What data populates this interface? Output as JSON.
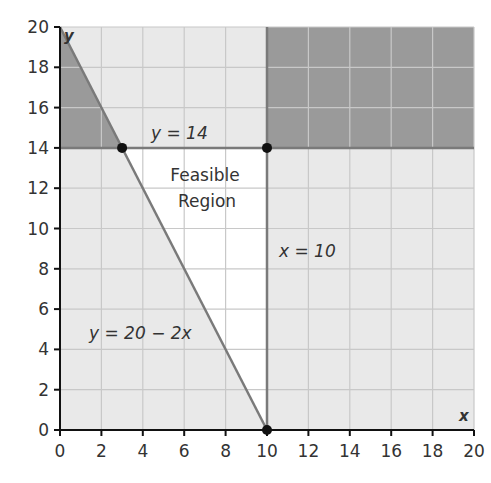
{
  "chart_data": {
    "type": "line",
    "title": "",
    "xlabel": "x",
    "ylabel": "y",
    "xlim": [
      0,
      20
    ],
    "ylim": [
      0,
      20
    ],
    "grid": true,
    "x_ticks": [
      "0",
      "2",
      "4",
      "6",
      "8",
      "10",
      "12",
      "14",
      "16",
      "18",
      "20"
    ],
    "y_ticks": [
      "0",
      "2",
      "4",
      "6",
      "8",
      "10",
      "12",
      "14",
      "16",
      "18",
      "20"
    ],
    "series": [
      {
        "name": "y = 20 − 2x",
        "x": [
          0,
          10
        ],
        "y": [
          20,
          0
        ]
      },
      {
        "name": "y = 14",
        "x": [
          0,
          20
        ],
        "y": [
          14,
          14
        ]
      },
      {
        "name": "x = 10",
        "x": [
          10,
          10
        ],
        "y": [
          0,
          20
        ]
      }
    ],
    "points": [
      {
        "x": 3,
        "y": 14
      },
      {
        "x": 10,
        "y": 14
      },
      {
        "x": 10,
        "y": 0
      }
    ],
    "regions": [
      {
        "name": "Feasible Region",
        "vertices": [
          [
            3,
            14
          ],
          [
            10,
            14
          ],
          [
            10,
            0
          ]
        ],
        "fill": "#ffffff"
      }
    ],
    "annotations": [
      {
        "text": "y = 14",
        "x": 6.5,
        "y": 14.8
      },
      {
        "text": "Feasible Region",
        "x": 7,
        "y": 12
      },
      {
        "text": "x = 10",
        "x": 11.7,
        "y": 9
      },
      {
        "text": "y = 20 − 2x",
        "x": 3.2,
        "y": 5
      }
    ]
  },
  "labels": {
    "y_eq_14": "y = 14",
    "feasible_1": "Feasible",
    "feasible_2": "Region",
    "x_eq_10": "x = 10",
    "line_eq": "y = 20 − 2x",
    "x_axis": "x",
    "y_axis": "y"
  },
  "colors": {
    "light_shade": "#e9e9e9",
    "dark_shade": "#9a9a9a",
    "feasible": "#ffffff",
    "grid": "#c8c8c8",
    "boundary": "#7a7a7a",
    "axis": "#111111",
    "point": "#111111"
  }
}
